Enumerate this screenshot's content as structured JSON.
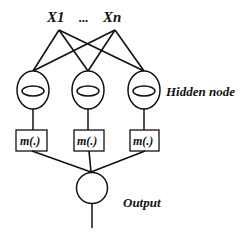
{
  "diagram": {
    "type": "neural-network",
    "inputs": {
      "first_label": "X1",
      "ellipsis": "...",
      "last_label": "Xn"
    },
    "hidden_layer": {
      "label": "Hidden node",
      "node_count": 3
    },
    "transform_boxes": [
      "m(.)",
      "m(.)",
      "m(.)"
    ],
    "output": {
      "label": "Output"
    },
    "colors": {
      "stroke": "#111111",
      "background": "#ffffff"
    }
  }
}
